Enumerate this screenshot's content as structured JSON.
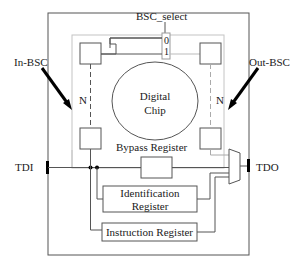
{
  "diagram": {
    "labels": {
      "bsc_select": "BSC_select",
      "mux_in_0": "0",
      "mux_in_1": "1",
      "in_bsc": "In-BSC",
      "out_bsc": "Out-BSC",
      "n_left": "N",
      "n_right": "N",
      "chip_line1": "Digital",
      "chip_line2": "Chip",
      "bypass": "Bypass Register",
      "tdi": "TDI",
      "tdo": "TDO",
      "id_line1": "Identification",
      "id_line2": "Register",
      "instruction": "Instruction Register"
    },
    "colors": {
      "line": "#333333",
      "light_line": "#b8b8b8",
      "arrow": "#000000",
      "background": "#ffffff"
    }
  }
}
